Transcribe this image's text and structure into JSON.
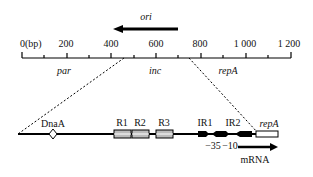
{
  "ori": {
    "label": "ori"
  },
  "ruler": {
    "unit_label": "0(bp)",
    "ticks": [
      "200",
      "400",
      "600",
      "800",
      "1 000",
      "1 200"
    ],
    "regions": [
      "par",
      "inc",
      "repA"
    ]
  },
  "detail": {
    "dnaa": "DnaA",
    "repeats": [
      "R1",
      "R2",
      "R3"
    ],
    "inverted_repeats": [
      "IR1",
      "IR2"
    ],
    "gene": "repA",
    "promoter_35": "−35",
    "promoter_10": "−10",
    "transcript": "mRNA"
  }
}
